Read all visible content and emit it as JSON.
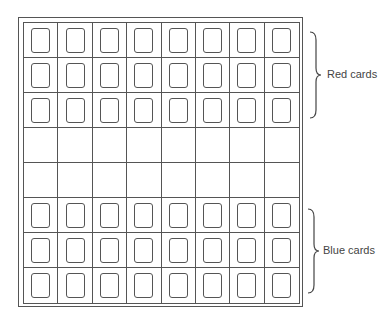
{
  "diagram": {
    "grid": {
      "rows": 8,
      "columns": 8,
      "row_contents": [
        "card",
        "card",
        "card",
        "empty",
        "empty",
        "card",
        "card",
        "card"
      ]
    },
    "labels": {
      "top_group": "Red cards",
      "bottom_group": "Blue cards"
    }
  }
}
